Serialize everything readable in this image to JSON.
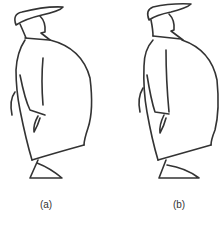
{
  "figures": [
    {
      "id": "a",
      "label": "(a)",
      "description": "cartoon figure in profile with long coat and flat cap"
    },
    {
      "id": "b",
      "label": "(b)",
      "description": "cartoon figure in profile with long coat and flat cap, slightly varied pose"
    }
  ],
  "colors": {
    "stroke": "#333333",
    "background": "#ffffff"
  }
}
